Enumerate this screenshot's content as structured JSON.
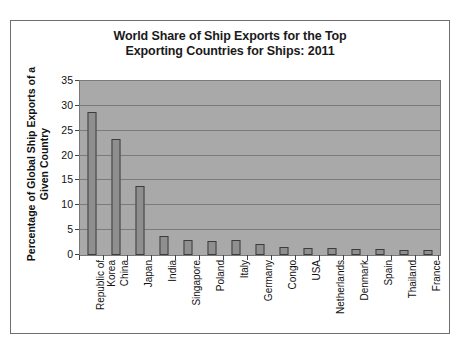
{
  "chart_data": {
    "type": "bar",
    "title": "World Share of Ship Exports for the Top Exporting Countries for Ships: 2011",
    "title_lines": [
      "World Share of Ship Exports for the Top",
      "Exporting Countries for Ships: 2011"
    ],
    "xlabel": "",
    "ylabel": "Percentage of Global Ship Exports of a Given Country",
    "ylabel_lines": [
      "Percentage of Global Ship Exports of a",
      "Given Country"
    ],
    "ylim": [
      0,
      35
    ],
    "yticks": [
      0,
      5,
      10,
      15,
      20,
      25,
      30,
      35
    ],
    "ytick_labels": [
      "0",
      "5",
      "10",
      "15",
      "20",
      "25",
      "30",
      "35"
    ],
    "grid": true,
    "legend": false,
    "categories": [
      "Republic of\nKorea",
      "China",
      "Japan",
      "India",
      "Singapore",
      "Poland",
      "Italy",
      "Germany",
      "Congo",
      "USA",
      "Netherlands",
      "Denmark",
      "Spain",
      "Thailand",
      "France"
    ],
    "values": [
      28.8,
      23.3,
      13.8,
      3.9,
      3.0,
      2.8,
      3.0,
      2.2,
      1.7,
      1.5,
      1.4,
      1.3,
      1.2,
      1.1,
      1.1
    ],
    "colors": {
      "bar_fill": "#8f8f8f",
      "bar_edge": "#3c3c3c",
      "plot_background": "#a9a9a9",
      "gridline": "#7a7a7a",
      "page_background": "#ffffff",
      "frame_border": "#6e6e6e",
      "text": "#111111"
    }
  }
}
